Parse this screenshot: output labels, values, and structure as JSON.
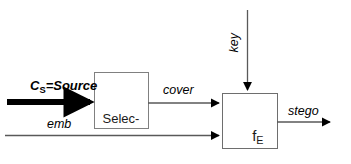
{
  "diagram": {
    "type": "block-flow-diagram",
    "background_color": "#ffffff",
    "line_color": "#595959",
    "emphasis_color": "#000000",
    "blocks": [
      {
        "id": "selection",
        "label_line1": "Selec-",
        "label_line2": "tion",
        "x": 94,
        "y": 72,
        "w": 54,
        "h": 56
      },
      {
        "id": "embedder",
        "label_base": "f",
        "label_sub": "E",
        "x": 222,
        "y": 93,
        "w": 55,
        "h": 55
      }
    ],
    "labels": {
      "source": {
        "base": "C",
        "sub": "S",
        "rest": "=Source"
      },
      "cover": "cover",
      "emb": "emb",
      "key": "key",
      "stego": "stego"
    },
    "edges": [
      {
        "id": "source-to-selection",
        "from": "input",
        "to": "selection",
        "style": "thick-arrow",
        "label": "C_S=Source"
      },
      {
        "id": "selection-to-embedder",
        "from": "selection",
        "to": "embedder",
        "style": "thin-arrow",
        "label": "cover"
      },
      {
        "id": "emb-to-embedder",
        "from": "input",
        "to": "embedder",
        "style": "thin-arrow",
        "label": "emb"
      },
      {
        "id": "key-to-embedder",
        "from": "input",
        "to": "embedder",
        "style": "thin-arrow-down",
        "label": "key"
      },
      {
        "id": "embedder-to-stego",
        "from": "embedder",
        "to": "output",
        "style": "thin-arrow",
        "label": "stego"
      }
    ]
  }
}
